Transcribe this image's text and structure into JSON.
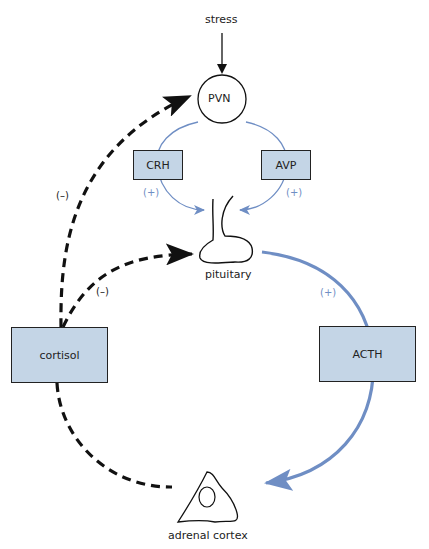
{
  "diagram": {
    "nodes": {
      "stress": "stress",
      "pvn": "PVN",
      "crh": "CRH",
      "avp": "AVP",
      "pituitary": "pituitary",
      "acth": "ACTH",
      "cortisol": "cortisol",
      "adrenal": "adrenal cortex"
    },
    "signs": {
      "crh_plus": "(+)",
      "avp_plus": "(+)",
      "acth_plus": "(+)",
      "pvn_minus": "(–)",
      "pit_minus": "(–)"
    },
    "colors": {
      "box_fill": "#c4d5e6",
      "stim_line": "#6f8ec4",
      "inhib_line": "#111111"
    }
  }
}
